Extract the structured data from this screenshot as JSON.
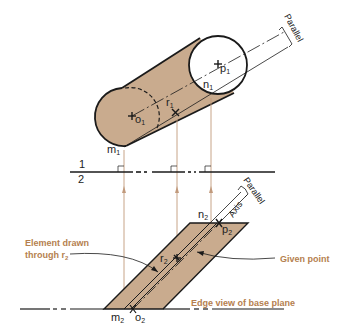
{
  "colors": {
    "fill": "#c9ab8e",
    "line": "#1a1a1a",
    "projection": "#c19a7c",
    "annotation": "#b5804f"
  },
  "top_view": {
    "points": {
      "o1": "o",
      "o1_sub": "1",
      "p1": "p",
      "p1_sub": "1",
      "n1": "n",
      "n1_sub": "1",
      "r1": "r",
      "r1_sub": "1",
      "m1": "m",
      "m1_sub": "1"
    },
    "parallel_label": "Parallel"
  },
  "reference_line": {
    "upper": "1",
    "lower": "2"
  },
  "front_view": {
    "points": {
      "n2": "n",
      "n2_sub": "2",
      "p2": "p",
      "p2_sub": "2",
      "r2": "r",
      "r2_sub": "2",
      "m2": "m",
      "m2_sub": "2",
      "o2": "o",
      "o2_sub": "2"
    },
    "parallel_label": "Parallel",
    "axis_label": "Axis"
  },
  "annotations": {
    "element_line1": "Element drawn",
    "element_line2": "through r",
    "element_sub": "2",
    "given_point": "Given point",
    "edge_view": "Edge view of base plane"
  }
}
